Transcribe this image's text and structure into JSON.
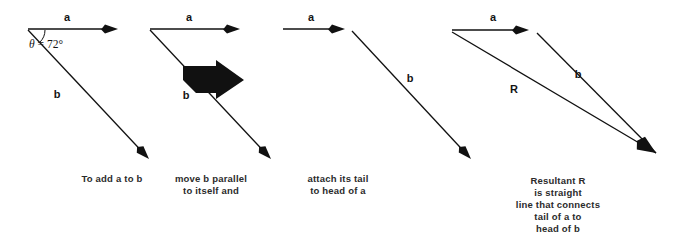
{
  "figure": {
    "background_color": "#ffffff",
    "ink_color": "#111111",
    "caption_color": "#2b2b2b",
    "width": 675,
    "height": 250
  },
  "panels": [
    {
      "id": "panel-1",
      "caption_lines": [
        "To add a to b"
      ],
      "caption_x": 112,
      "caption_y": 182,
      "labels": [
        {
          "name": "label-a",
          "text": "a",
          "x": 67,
          "y": 21
        },
        {
          "name": "label-b",
          "text": "b",
          "x": 57,
          "y": 98
        },
        {
          "name": "label-theta",
          "text": "θ = 72°",
          "x": 46,
          "y": 48
        }
      ],
      "vectors": [
        {
          "name": "vector-a",
          "x1": 28,
          "y1": 29,
          "x2": 118,
          "y2": 29,
          "width": 1.3,
          "head": "thin"
        },
        {
          "name": "vector-b",
          "x1": 28,
          "y1": 30,
          "x2": 149,
          "y2": 159,
          "width": 1.3,
          "head": "thin"
        }
      ],
      "angle_arc": {
        "name": "angle-arc",
        "cx": 28,
        "cy": 30,
        "r": 17,
        "start_deg": 0,
        "end_deg": 47
      },
      "block_arrow": null
    },
    {
      "id": "panel-2",
      "caption_lines": [
        "move b parallel",
        "to itself and"
      ],
      "caption_x": 211,
      "caption_y": 182,
      "labels": [
        {
          "name": "label-a",
          "text": "a",
          "x": 189,
          "y": 21
        },
        {
          "name": "label-b",
          "text": "b",
          "x": 186,
          "y": 99
        }
      ],
      "vectors": [
        {
          "name": "vector-a",
          "x1": 150,
          "y1": 29,
          "x2": 240,
          "y2": 29,
          "width": 1.3,
          "head": "thin"
        },
        {
          "name": "vector-b",
          "x1": 150,
          "y1": 30,
          "x2": 271,
          "y2": 159,
          "width": 1.3,
          "head": "thin"
        }
      ],
      "angle_arc": null,
      "block_arrow": {
        "name": "motion-block-arrow",
        "points": "183,66 216,66 216,60 244,80 216,99 216,93 196,93 183,80"
      }
    },
    {
      "id": "panel-3",
      "caption_lines": [
        "attach its tail",
        "to head of a"
      ],
      "caption_x": 338,
      "caption_y": 182,
      "labels": [
        {
          "name": "label-a",
          "text": "a",
          "x": 311,
          "y": 21
        },
        {
          "name": "label-b",
          "text": "b",
          "x": 410,
          "y": 82
        }
      ],
      "vectors": [
        {
          "name": "vector-a",
          "x1": 283,
          "y1": 29,
          "x2": 345,
          "y2": 29,
          "width": 1.3,
          "head": "thin"
        },
        {
          "name": "vector-b",
          "x1": 352,
          "y1": 31,
          "x2": 471,
          "y2": 159,
          "width": 1.3,
          "head": "thin"
        }
      ],
      "angle_arc": null,
      "block_arrow": null
    },
    {
      "id": "panel-4",
      "caption_lines": [
        "Resultant R",
        "is straight",
        "line that connects",
        "tail of a to",
        "head of b"
      ],
      "caption_x": 558,
      "caption_y": 184,
      "labels": [
        {
          "name": "label-a",
          "text": "a",
          "x": 493,
          "y": 21
        },
        {
          "name": "label-b",
          "text": "b",
          "x": 578,
          "y": 78
        },
        {
          "name": "label-R",
          "text": "R",
          "x": 514,
          "y": 93
        }
      ],
      "vectors": [
        {
          "name": "vector-a",
          "x1": 452,
          "y1": 30,
          "x2": 529,
          "y2": 30,
          "width": 1.3,
          "head": "thin"
        },
        {
          "name": "vector-b",
          "x1": 537,
          "y1": 33,
          "x2": 656,
          "y2": 153,
          "width": 1.3,
          "head": "none"
        },
        {
          "name": "vector-resultant-R",
          "x1": 452,
          "y1": 32,
          "x2": 656,
          "y2": 153,
          "width": 1.3,
          "head": "none"
        }
      ],
      "shared_head": {
        "name": "resultant-arrowhead",
        "x": 656,
        "y": 153,
        "angle_deg": 33,
        "size": 18
      },
      "angle_arc": null,
      "block_arrow": null
    }
  ]
}
